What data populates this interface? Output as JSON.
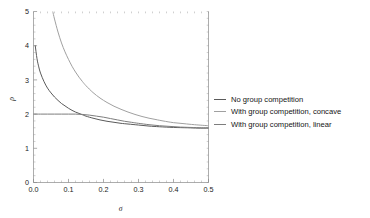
{
  "chart_data": {
    "type": "line",
    "title": "",
    "xlabel": "σ",
    "ylabel": "ρ",
    "xlim": [
      0.0,
      0.5
    ],
    "ylim": [
      0,
      5
    ],
    "grid": false,
    "legend_position": "right",
    "xticks": [
      0.0,
      0.1,
      0.2,
      0.3,
      0.4,
      0.5
    ],
    "xticklabels": [
      "0.0",
      "0.1",
      "0.2",
      "0.3",
      "0.4",
      "0.5"
    ],
    "yticks": [
      0,
      1,
      2,
      3,
      4,
      5
    ],
    "yticklabels": [
      "0",
      "1",
      "2",
      "3",
      "4",
      "5"
    ],
    "x_minor_tick_interval": 0.02,
    "y_minor_tick_interval": 0.2,
    "series": [
      {
        "name": "No group competition",
        "color": "#5a5a5a",
        "x": [
          0.005,
          0.01,
          0.015,
          0.02,
          0.03,
          0.04,
          0.05,
          0.06,
          0.07,
          0.08,
          0.09,
          0.1,
          0.11,
          0.12,
          0.13,
          0.14,
          0.15,
          0.17,
          0.19,
          0.21,
          0.23,
          0.25,
          0.27,
          0.3,
          0.33,
          0.36,
          0.4,
          0.44,
          0.47,
          0.5
        ],
        "y": [
          4.0,
          3.62,
          3.38,
          3.2,
          2.95,
          2.76,
          2.62,
          2.5,
          2.4,
          2.31,
          2.24,
          2.17,
          2.11,
          2.06,
          2.02,
          1.98,
          1.94,
          1.88,
          1.83,
          1.79,
          1.76,
          1.73,
          1.71,
          1.68,
          1.65,
          1.63,
          1.61,
          1.6,
          1.59,
          1.59
        ]
      },
      {
        "name": "With group competition, concave",
        "color": "#a0a0a0",
        "x": [
          0.055,
          0.06,
          0.07,
          0.08,
          0.09,
          0.1,
          0.11,
          0.12,
          0.13,
          0.14,
          0.15,
          0.17,
          0.19,
          0.21,
          0.23,
          0.25,
          0.27,
          0.29,
          0.31,
          0.33,
          0.35,
          0.37,
          0.4,
          0.43,
          0.46,
          0.5
        ],
        "y": [
          5.0,
          4.78,
          4.4,
          4.08,
          3.82,
          3.6,
          3.4,
          3.23,
          3.08,
          2.95,
          2.83,
          2.63,
          2.47,
          2.34,
          2.23,
          2.14,
          2.06,
          1.99,
          1.93,
          1.88,
          1.84,
          1.8,
          1.75,
          1.72,
          1.69,
          1.66
        ]
      },
      {
        "name": "With group competition, linear",
        "color": "#7d7d7d",
        "x": [
          0.0,
          0.02,
          0.04,
          0.06,
          0.08,
          0.1,
          0.12,
          0.14,
          0.16,
          0.18,
          0.2,
          0.22,
          0.24,
          0.26,
          0.28,
          0.3,
          0.33,
          0.36,
          0.39,
          0.42,
          0.45,
          0.48,
          0.5
        ],
        "y": [
          2.0,
          2.0,
          2.0,
          2.0,
          2.0,
          2.0,
          2.0,
          1.99,
          1.97,
          1.94,
          1.91,
          1.87,
          1.83,
          1.79,
          1.76,
          1.73,
          1.69,
          1.66,
          1.64,
          1.62,
          1.61,
          1.6,
          1.6
        ]
      }
    ]
  },
  "legend": {
    "items": [
      {
        "label": "No group competition",
        "color": "#5a5a5a"
      },
      {
        "label": "With group competition, concave",
        "color": "#a0a0a0"
      },
      {
        "label": "With group competition, linear",
        "color": "#7d7d7d"
      }
    ]
  },
  "axes": {
    "x_title": "σ",
    "y_title": "ρ"
  }
}
